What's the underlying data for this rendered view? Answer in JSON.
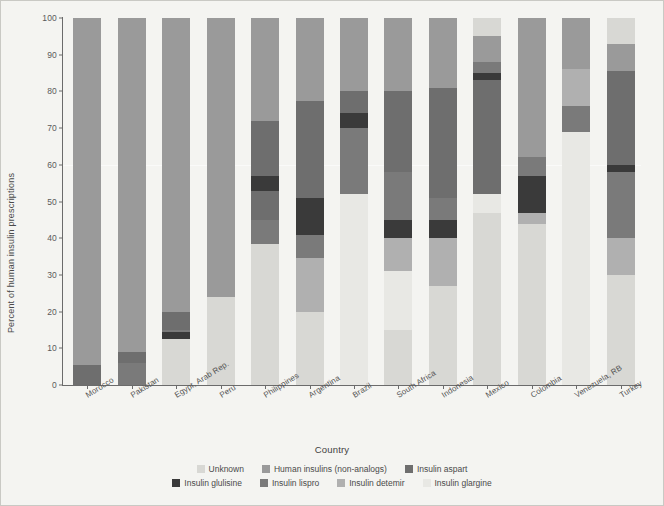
{
  "axes": {
    "ylabel": "Percent of human insulin prescriptions",
    "xlabel": "Country",
    "yticks": [
      "0",
      "10",
      "20",
      "30",
      "40",
      "50",
      "60",
      "70",
      "80",
      "90",
      "100"
    ]
  },
  "legend": {
    "row1": [
      {
        "label": "Unknown",
        "color": "#d8d8d4"
      },
      {
        "label": "Human insulins (non-analogs)",
        "color": "#9a9a9a"
      },
      {
        "label": "Insulin aspart",
        "color": "#6e6e6e"
      }
    ],
    "row2": [
      {
        "label": "Insulin glulisine",
        "color": "#3a3a3a"
      },
      {
        "label": "Insulin lispro",
        "color": "#7a7a7a"
      },
      {
        "label": "Insulin detemir",
        "color": "#b0b0b0"
      },
      {
        "label": "Insulin glargine",
        "color": "#e8e8e4"
      }
    ]
  },
  "chart_data": {
    "type": "bar",
    "stacked": true,
    "title": "",
    "xlabel": "Country",
    "ylabel": "Percent of human insulin prescriptions",
    "ylim": [
      0,
      100
    ],
    "ytick_step": 10,
    "grid": false,
    "legend_position": "bottom",
    "categories": [
      "Morocco",
      "Pakistan",
      "Egypt, Arab Rep.",
      "Peru",
      "Philippines",
      "Argentina",
      "Brazil",
      "South Africa",
      "Indonesia",
      "Mexico",
      "Colombia",
      "Venezuela, RB",
      "Turkey"
    ],
    "series": [
      {
        "name": "Unknown",
        "color": "#d8d8d4",
        "values": [
          0,
          0,
          12.5,
          24,
          38.5,
          20,
          0,
          15,
          0,
          0,
          44,
          0,
          0
        ]
      },
      {
        "name": "Human insulins (non-analogs)",
        "color": "#9a9a9a",
        "values": [
          94.5,
          91,
          80,
          76,
          28,
          49,
          40,
          20,
          73,
          52,
          0,
          14,
          7
        ]
      },
      {
        "name": "Insulin aspart",
        "color": "#6e6e6e",
        "values": [
          5.5,
          2,
          5,
          0,
          15,
          0,
          0,
          20,
          0,
          0,
          0,
          0,
          0
        ]
      },
      {
        "name": "Insulin glulisine",
        "color": "#3a3a3a",
        "values": [
          0,
          0,
          1,
          0,
          4,
          10,
          10,
          4,
          0,
          5,
          13,
          0,
          6
        ]
      },
      {
        "name": "Insulin lispro",
        "color": "#7a7a7a",
        "values": [
          0,
          7,
          1.5,
          0,
          15,
          6.5,
          30,
          12,
          12,
          26,
          12,
          0,
          26
        ]
      },
      {
        "name": "Insulin detemir",
        "color": "#b0b0b0",
        "values": [
          0,
          0,
          0,
          0,
          0,
          14.5,
          0,
          9,
          15,
          0,
          19,
          0,
          31
        ]
      },
      {
        "name": "Insulin glargine",
        "color": "#e8e8e4",
        "values": [
          0,
          0,
          0,
          0,
          0,
          0,
          20,
          20,
          0,
          17,
          12,
          86,
          30
        ]
      }
    ],
    "bar_boundaries": {
      "Morocco": [
        {
          "series": "Insulin aspart",
          "from": 0,
          "to": 5.5
        },
        {
          "series": "Human insulins (non-analogs)",
          "from": 5.5,
          "to": 100
        }
      ],
      "Pakistan": [
        {
          "series": "Insulin lispro",
          "from": 0,
          "to": 6
        },
        {
          "series": "Insulin aspart",
          "from": 6,
          "to": 9
        },
        {
          "series": "Human insulins (non-analogs)",
          "from": 9,
          "to": 100
        }
      ],
      "Egypt, Arab Rep.": [
        {
          "series": "Unknown",
          "from": 0,
          "to": 12.5
        },
        {
          "series": "Insulin glulisine",
          "from": 12.5,
          "to": 14.5
        },
        {
          "series": "Insulin lispro",
          "from": 14.5,
          "to": 15
        },
        {
          "series": "Insulin aspart",
          "from": 15,
          "to": 20
        },
        {
          "series": "Human insulins (non-analogs)",
          "from": 20,
          "to": 100
        }
      ],
      "Peru": [
        {
          "series": "Unknown",
          "from": 0,
          "to": 24
        },
        {
          "series": "Human insulins (non-analogs)",
          "from": 24,
          "to": 100
        }
      ],
      "Philippines": [
        {
          "series": "Unknown",
          "from": 0,
          "to": 38.5
        },
        {
          "series": "Insulin lispro",
          "from": 38.5,
          "to": 45
        },
        {
          "series": "Insulin aspart",
          "from": 45,
          "to": 53
        },
        {
          "series": "Insulin glulisine",
          "from": 53,
          "to": 57
        },
        {
          "series": "Insulin aspart",
          "from": 57,
          "to": 72
        },
        {
          "series": "Human insulins (non-analogs)",
          "from": 72,
          "to": 100
        }
      ],
      "Argentina": [
        {
          "series": "Unknown",
          "from": 0,
          "to": 20
        },
        {
          "series": "Insulin detemir",
          "from": 20,
          "to": 34.5
        },
        {
          "series": "Insulin lispro",
          "from": 34.5,
          "to": 41
        },
        {
          "series": "Insulin glulisine",
          "from": 41,
          "to": 51
        },
        {
          "series": "Insulin aspart",
          "from": 51,
          "to": 77.5
        },
        {
          "series": "Human insulins (non-analogs)",
          "from": 77.5,
          "to": 100
        }
      ],
      "Brazil": [
        {
          "series": "Insulin glargine",
          "from": 0,
          "to": 52
        },
        {
          "series": "Insulin lispro",
          "from": 52,
          "to": 70
        },
        {
          "series": "Insulin glulisine",
          "from": 70,
          "to": 74
        },
        {
          "series": "Insulin aspart",
          "from": 74,
          "to": 80
        },
        {
          "series": "Human insulins (non-analogs)",
          "from": 80,
          "to": 100
        }
      ],
      "South Africa": [
        {
          "series": "Unknown",
          "from": 0,
          "to": 15
        },
        {
          "series": "Insulin glargine",
          "from": 15,
          "to": 31
        },
        {
          "series": "Insulin detemir",
          "from": 31,
          "to": 40
        },
        {
          "series": "Insulin glulisine",
          "from": 40,
          "to": 45
        },
        {
          "series": "Insulin lispro",
          "from": 45,
          "to": 58
        },
        {
          "series": "Insulin aspart",
          "from": 58,
          "to": 80
        },
        {
          "series": "Human insulins (non-analogs)",
          "from": 80,
          "to": 100
        }
      ],
      "Indonesia": [
        {
          "series": "Unknown",
          "from": 0,
          "to": 27
        },
        {
          "series": "Insulin detemir",
          "from": 27,
          "to": 40
        },
        {
          "series": "Insulin glulisine",
          "from": 40,
          "to": 45
        },
        {
          "series": "Insulin lispro",
          "from": 45,
          "to": 51
        },
        {
          "series": "Insulin aspart",
          "from": 51,
          "to": 81
        },
        {
          "series": "Human insulins (non-analogs)",
          "from": 81,
          "to": 100
        }
      ],
      "Mexico": [
        {
          "series": "Unknown",
          "from": 0,
          "to": 47
        },
        {
          "series": "Insulin glargine",
          "from": 47,
          "to": 52
        },
        {
          "series": "Insulin aspart",
          "from": 52,
          "to": 83
        },
        {
          "series": "Insulin glulisine",
          "from": 83,
          "to": 85
        },
        {
          "series": "Insulin lispro",
          "from": 85,
          "to": 88
        },
        {
          "series": "Human insulins (non-analogs)",
          "from": 88,
          "to": 95
        },
        {
          "series": "Unknown",
          "from": 95,
          "to": 100
        }
      ],
      "Colombia": [
        {
          "series": "Unknown",
          "from": 0,
          "to": 44
        },
        {
          "series": "Insulin detemir",
          "from": 44,
          "to": 47
        },
        {
          "series": "Insulin glulisine",
          "from": 47,
          "to": 57
        },
        {
          "series": "Insulin lispro",
          "from": 57,
          "to": 62
        },
        {
          "series": "Human insulins (non-analogs)",
          "from": 62,
          "to": 100
        }
      ],
      "Venezuela, RB": [
        {
          "series": "Insulin glargine",
          "from": 0,
          "to": 69
        },
        {
          "series": "Insulin lispro",
          "from": 69,
          "to": 76
        },
        {
          "series": "Insulin detemir",
          "from": 76,
          "to": 86
        },
        {
          "series": "Human insulins (non-analogs)",
          "from": 86,
          "to": 100
        }
      ],
      "Turkey": [
        {
          "series": "Unknown",
          "from": 0,
          "to": 30
        },
        {
          "series": "Insulin detemir",
          "from": 30,
          "to": 40
        },
        {
          "series": "Insulin lispro",
          "from": 40,
          "to": 58
        },
        {
          "series": "Insulin glulisine",
          "from": 58,
          "to": 60
        },
        {
          "series": "Insulin aspart",
          "from": 60,
          "to": 85.5
        },
        {
          "series": "Human insulins (non-analogs)",
          "from": 85.5,
          "to": 93
        },
        {
          "series": "Unknown",
          "from": 93,
          "to": 100
        }
      ]
    }
  }
}
